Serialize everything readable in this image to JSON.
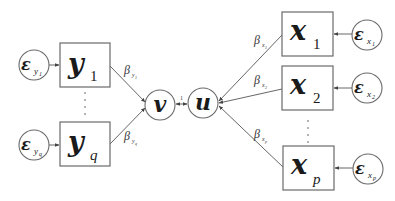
{
  "diagram": {
    "type": "path-diagram",
    "latent": {
      "v": {
        "label": "v"
      },
      "u": {
        "label": "u"
      },
      "link_label": "1"
    },
    "y_indicators": [
      {
        "id": "y1",
        "main": "y",
        "sub": "1",
        "error": {
          "main": "ε",
          "sub": "y",
          "subsub": "1"
        },
        "beta": {
          "main": "β",
          "sub": "y",
          "subsub": "1"
        }
      },
      {
        "id": "yq",
        "main": "y",
        "sub": "q",
        "error": {
          "main": "ε",
          "sub": "y",
          "subsub": "q"
        },
        "beta": {
          "main": "β",
          "sub": "y",
          "subsub": "q"
        }
      }
    ],
    "x_indicators": [
      {
        "id": "x1",
        "main": "x",
        "sub": "1",
        "error": {
          "main": "ε",
          "sub": "x",
          "subsub": "1"
        },
        "beta": {
          "main": "β",
          "sub": "x",
          "subsub": "1"
        }
      },
      {
        "id": "x2",
        "main": "x",
        "sub": "2",
        "error": {
          "main": "ε",
          "sub": "x",
          "subsub": "2"
        },
        "beta": {
          "main": "β",
          "sub": "x",
          "subsub": "2"
        }
      },
      {
        "id": "xp",
        "main": "x",
        "sub": "p",
        "error": {
          "main": "ε",
          "sub": "x",
          "subsub": "p"
        },
        "beta": {
          "main": "β",
          "sub": "x",
          "subsub": "p"
        }
      }
    ],
    "ellipsis": "⋮",
    "colors": {
      "stroke": "#6a6a6a",
      "text": "#1a1a1a",
      "background": "#ffffff"
    }
  }
}
